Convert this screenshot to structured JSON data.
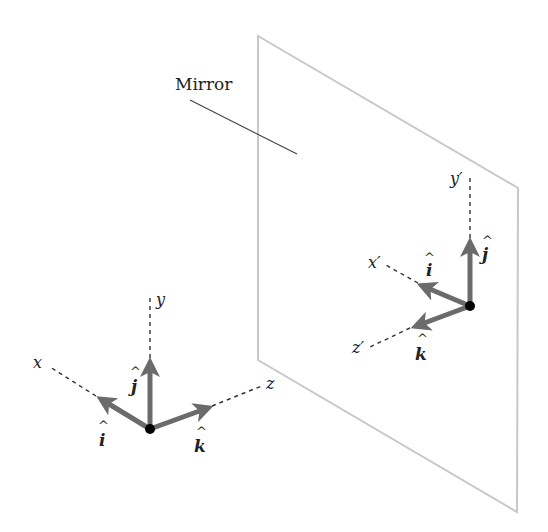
{
  "mirror": {
    "label": "Mirror",
    "corners": [
      [
        258,
        36
      ],
      [
        518,
        188
      ],
      [
        517,
        512
      ],
      [
        258,
        360
      ]
    ],
    "stroke_color": "#c8c8c8"
  },
  "colors": {
    "arrow": "#6b6b6b",
    "axis_dash": "#333333",
    "origin_dot": "#000000",
    "text": "#222222"
  },
  "left_frame": {
    "axes": {
      "x": "x",
      "y": "y",
      "z": "z"
    },
    "unit_vectors": {
      "i": "i",
      "j": "j",
      "k": "k",
      "hat": "^"
    }
  },
  "right_frame": {
    "axes": {
      "x": "x′",
      "y": "y′",
      "z": "z′"
    },
    "unit_vectors": {
      "i": "i",
      "j": "j",
      "k": "k",
      "hat": "^"
    }
  }
}
